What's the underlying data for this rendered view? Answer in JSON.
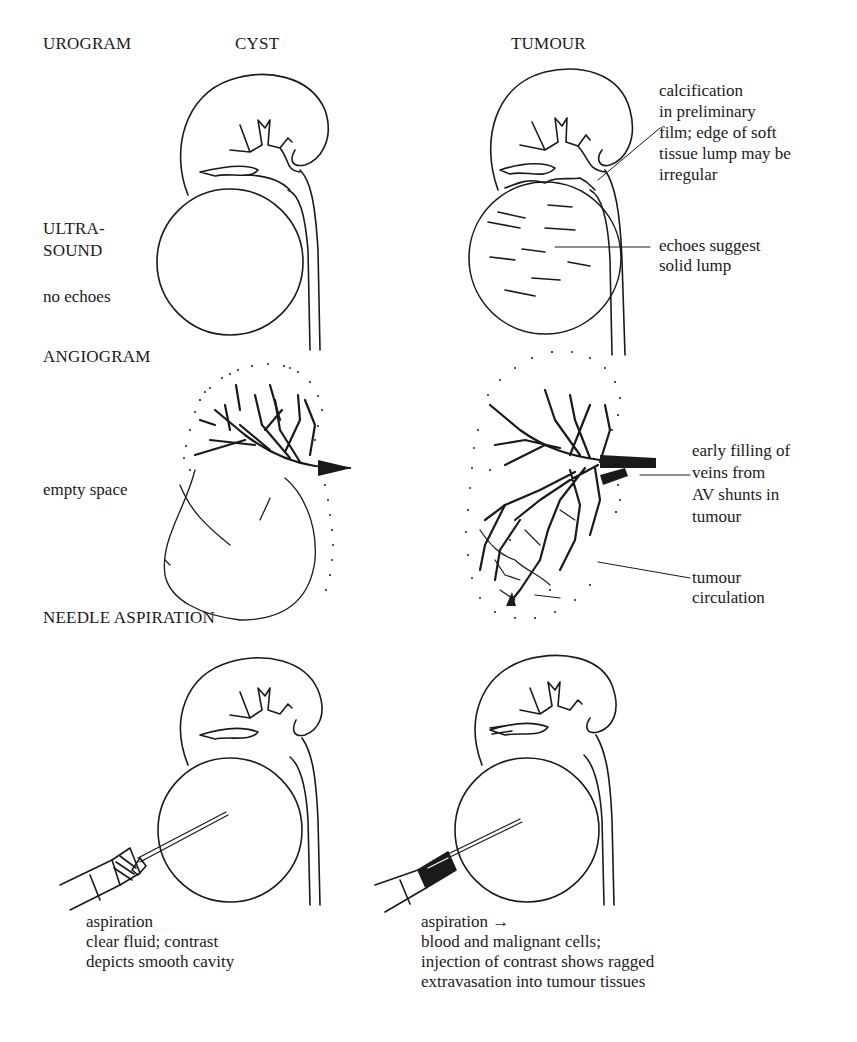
{
  "column_headers": {
    "cyst": "CYST",
    "tumour": "TUMOUR"
  },
  "rows": {
    "urogram": {
      "title": "UROGRAM",
      "tumour_note": "calcification\nin preliminary\nfilm; edge of soft\ntissue lump may be\nirregular"
    },
    "ultrasound": {
      "title": "ULTRA-\nSOUND",
      "cyst_note": "no echoes",
      "tumour_note": "echoes suggest\nsolid lump"
    },
    "angiogram": {
      "title": "ANGIOGRAM",
      "cyst_note": "empty space",
      "tumour_note_shunts": "early filling of\nveins from\nAV shunts in\ntumour",
      "tumour_note_circulation": "tumour\ncirculation"
    },
    "needle_aspiration": {
      "title": "NEEDLE ASPIRATION",
      "cyst_note": "aspiration\nclear fluid; contrast\ndepicts smooth cavity",
      "tumour_note_head": "aspiration",
      "tumour_note_arrow": "→",
      "tumour_note": "blood and malignant cells;\ninjection of contrast shows ragged\nextravasation into tumour tissues"
    }
  },
  "colors": {
    "ink": "#1a1a1a",
    "paper": "#ffffff"
  }
}
